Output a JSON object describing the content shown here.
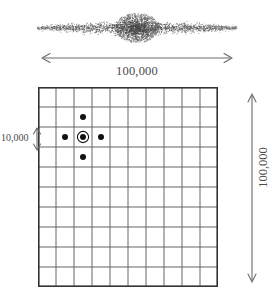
{
  "figure": {
    "name": "milky-way-scale-diagram",
    "background_color": "#ffffff",
    "ink_color": "#3a3a3a",
    "line_color": "#555555"
  },
  "galaxy": {
    "name": "edge-on-galaxy-illustration",
    "description": "stippled edge-on spiral galaxy with central bulge",
    "dot_color": "#4a4a4a",
    "center_x": 107,
    "center_y": 26,
    "disk_half_length": 100,
    "disk_half_thickness": 4,
    "bulge_radius_x": 22,
    "bulge_radius_y": 15,
    "dot_count_disk": 2600,
    "dot_count_bulge": 1700
  },
  "horizontal_scale": {
    "name": "galaxy-diameter-scale",
    "label": "100,000",
    "arrow_style": "double-headed",
    "orientation": "horizontal"
  },
  "vertical_scale": {
    "name": "grid-height-scale",
    "label": "100,000",
    "arrow_style": "double-headed",
    "orientation": "vertical"
  },
  "cell_scale": {
    "name": "grid-cell-scale",
    "label": "10,000",
    "arrow_style": "double-headed",
    "orientation": "vertical"
  },
  "grid": {
    "name": "coordinate-grid",
    "columns": 10,
    "rows": 10,
    "cell_width": 18,
    "cell_height": 20,
    "line_color": "#555555",
    "line_width": 0.9,
    "border_color": "#333333",
    "border_width": 1.6
  },
  "markers": {
    "name": "star-markers",
    "dot_color": "#111111",
    "dot_radius": 3.0,
    "ring_radius": 5.6,
    "ring_width": 1.1,
    "items": [
      {
        "name": "sun-marker",
        "col": 2,
        "row": 2,
        "ringed": true
      },
      {
        "name": "star-marker-north",
        "col": 2,
        "row": 1,
        "ringed": false
      },
      {
        "name": "star-marker-south",
        "col": 2,
        "row": 3,
        "ringed": false
      },
      {
        "name": "star-marker-west",
        "col": 1,
        "row": 2,
        "ringed": false
      },
      {
        "name": "star-marker-east",
        "col": 3,
        "row": 2,
        "ringed": false
      }
    ]
  },
  "chart_data": {
    "type": "scatter",
    "title": "",
    "xlabel": "100,000",
    "ylabel": "100,000",
    "grid": true,
    "legend": false,
    "x": [
      2.5,
      2.5,
      2.5,
      1.5,
      3.5
    ],
    "y": [
      2.5,
      1.5,
      3.5,
      2.5,
      2.5
    ],
    "labels": [
      "sun-marker",
      "star-marker-north",
      "star-marker-south",
      "star-marker-west",
      "star-marker-east"
    ],
    "xlim": [
      0,
      10
    ],
    "ylim": [
      0,
      10
    ],
    "annotations": [
      "100,000",
      "10,000",
      "100,000"
    ]
  }
}
